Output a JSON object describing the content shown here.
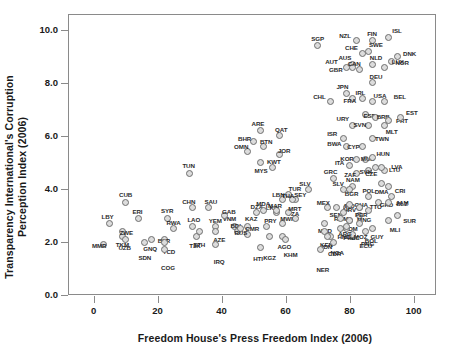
{
  "chart_data": {
    "type": "scatter",
    "title": "",
    "xlabel": "Freedom House's Press Freedom Index (2006)",
    "ylabel": "Transparency International's Corruption\nPerception Index (2006)",
    "xlim": [
      -8,
      107
    ],
    "ylim": [
      0.0,
      10.6
    ],
    "xticks": [
      0,
      20,
      40,
      60,
      80,
      100
    ],
    "xticklabels": [
      "0",
      "20",
      "40",
      "60",
      "80",
      "100"
    ],
    "yticks": [
      0.0,
      2.0,
      4.0,
      6.0,
      8.0,
      10.0
    ],
    "yticklabels": [
      "0.0",
      "2.0",
      "4.0",
      "6.0",
      "8.0",
      "10.0"
    ],
    "grid": false,
    "legend": null,
    "marker": {
      "shape": "circle",
      "face_color": "#dcdcdc",
      "edge_color": "#6f6f6f",
      "size": 7
    },
    "frame_color": "#8a8a8a",
    "points": [
      {
        "label": "SGP",
        "x": 70,
        "y": 9.4,
        "lx": 0,
        "ly": -8
      },
      {
        "label": "NZL",
        "x": 82,
        "y": 9.6,
        "lx": -11,
        "ly": -6
      },
      {
        "label": "FIN",
        "x": 87,
        "y": 9.6,
        "lx": 0,
        "ly": -8
      },
      {
        "label": "ISL",
        "x": 92,
        "y": 9.7,
        "lx": 9,
        "ly": -8
      },
      {
        "label": "CHE",
        "x": 84,
        "y": 9.1,
        "lx": -11,
        "ly": -7
      },
      {
        "label": "DNK",
        "x": 95,
        "y": 9.0,
        "lx": 12,
        "ly": -3
      },
      {
        "label": "AUS",
        "x": 81,
        "y": 8.7,
        "lx": -8,
        "ly": -7
      },
      {
        "label": "SWE",
        "x": 86,
        "y": 9.2,
        "lx": 7,
        "ly": -7
      },
      {
        "label": "NOR",
        "x": 93,
        "y": 8.8,
        "lx": 11,
        "ly": 0
      },
      {
        "label": "AUT",
        "x": 79,
        "y": 8.6,
        "lx": -15,
        "ly": -6
      },
      {
        "label": "NLD",
        "x": 87,
        "y": 8.7,
        "lx": 4,
        "ly": -7
      },
      {
        "label": "GBR",
        "x": 81,
        "y": 8.6,
        "lx": -17,
        "ly": 2
      },
      {
        "label": "CAN",
        "x": 83,
        "y": 8.5,
        "lx": -5,
        "ly": -7
      },
      {
        "label": "DEU",
        "x": 87,
        "y": 8.0,
        "lx": 4,
        "ly": -7
      },
      {
        "label": "LUX",
        "x": 91,
        "y": 8.6,
        "lx": 13,
        "ly": -6
      },
      {
        "label": "JPN",
        "x": 79,
        "y": 7.6,
        "lx": -4,
        "ly": -8
      },
      {
        "label": "IRL",
        "x": 84,
        "y": 7.4,
        "lx": -2,
        "ly": -7
      },
      {
        "label": "USA",
        "x": 87,
        "y": 7.3,
        "lx": 8,
        "ly": -7
      },
      {
        "label": "BEL",
        "x": 91,
        "y": 7.3,
        "lx": 15,
        "ly": -6
      },
      {
        "label": "CHL",
        "x": 74,
        "y": 7.3,
        "lx": -11,
        "ly": -6
      },
      {
        "label": "FRA",
        "x": 81,
        "y": 7.4,
        "lx": -3,
        "ly": 1
      },
      {
        "label": "ESP",
        "x": 85,
        "y": 6.8,
        "lx": 4,
        "ly": 0
      },
      {
        "label": "BRB",
        "x": 88,
        "y": 6.7,
        "lx": 8,
        "ly": -1
      },
      {
        "label": "PRT",
        "x": 92,
        "y": 6.6,
        "lx": 14,
        "ly": 0
      },
      {
        "label": "URY",
        "x": 81,
        "y": 6.4,
        "lx": -10,
        "ly": -7
      },
      {
        "label": "SVN",
        "x": 86,
        "y": 6.4,
        "lx": -9,
        "ly": -1
      },
      {
        "label": "EST",
        "x": 96,
        "y": 6.7,
        "lx": 11,
        "ly": -5
      },
      {
        "label": "MLT",
        "x": 91,
        "y": 6.4,
        "lx": 7,
        "ly": 6
      },
      {
        "label": "ISR",
        "x": 78,
        "y": 5.9,
        "lx": -11,
        "ly": -6
      },
      {
        "label": "BWA",
        "x": 79,
        "y": 5.6,
        "lx": -12,
        "ly": -4
      },
      {
        "label": "CYP",
        "x": 84,
        "y": 5.6,
        "lx": -9,
        "ly": -1
      },
      {
        "label": "TWN",
        "x": 87,
        "y": 5.9,
        "lx": 10,
        "ly": -1
      },
      {
        "label": "KOR",
        "x": 82,
        "y": 5.1,
        "lx": -9,
        "ly": -2
      },
      {
        "label": "MUS",
        "x": 85,
        "y": 5.1,
        "lx": 2,
        "ly": -2
      },
      {
        "label": "HUN",
        "x": 87,
        "y": 5.2,
        "lx": 11,
        "ly": -4
      },
      {
        "label": "ITA",
        "x": 80,
        "y": 4.9,
        "lx": -10,
        "ly": -3
      },
      {
        "label": "LVA",
        "x": 91,
        "y": 4.7,
        "lx": 12,
        "ly": -4
      },
      {
        "label": "ZAF",
        "x": 82,
        "y": 4.6,
        "lx": -6,
        "ly": 1
      },
      {
        "label": "SVK",
        "x": 86,
        "y": 4.7,
        "lx": -3,
        "ly": 1
      },
      {
        "label": "LTU",
        "x": 90,
        "y": 4.8,
        "lx": 13,
        "ly": 1
      },
      {
        "label": "CZE",
        "x": 88,
        "y": 4.8,
        "lx": -4,
        "ly": 5
      },
      {
        "label": "CRI",
        "x": 92,
        "y": 4.1,
        "lx": 12,
        "ly": 4
      },
      {
        "label": "DMA",
        "x": 90,
        "y": 4.2,
        "lx": 0,
        "ly": 7
      },
      {
        "label": "JAM",
        "x": 93,
        "y": 3.7,
        "lx": 11,
        "ly": 5
      },
      {
        "label": "GRC",
        "x": 75,
        "y": 4.4,
        "lx": -3,
        "ly": -7
      },
      {
        "label": "NAM",
        "x": 81,
        "y": 4.1,
        "lx": 0,
        "ly": -7
      },
      {
        "label": "SLV",
        "x": 78,
        "y": 4.0,
        "lx": -5,
        "ly": -6
      },
      {
        "label": "MEX",
        "x": 73,
        "y": 3.3,
        "lx": -4,
        "ly": -6
      },
      {
        "label": "BGR",
        "x": 80,
        "y": 4.0,
        "lx": 2,
        "ly": 4
      },
      {
        "label": "POL",
        "x": 86,
        "y": 3.7,
        "lx": 0,
        "ly": -7
      },
      {
        "label": "SEN",
        "x": 76,
        "y": 3.3,
        "lx": -1,
        "ly": 6
      },
      {
        "label": "IND",
        "x": 79,
        "y": 3.3,
        "lx": 3,
        "ly": -3
      },
      {
        "label": "GHA",
        "x": 83,
        "y": 3.3,
        "lx": 2,
        "ly": -4
      },
      {
        "label": "TTO",
        "x": 86,
        "y": 3.2,
        "lx": 7,
        "ly": -4
      },
      {
        "label": "GRD",
        "x": 89,
        "y": 3.5,
        "lx": 8,
        "ly": 2
      },
      {
        "label": "BLZ",
        "x": 92,
        "y": 3.5,
        "lx": 14,
        "ly": 1
      },
      {
        "label": "SUR",
        "x": 95,
        "y": 3.0,
        "lx": 12,
        "ly": 4
      },
      {
        "label": "HRV",
        "x": 80,
        "y": 3.4,
        "lx": 0,
        "ly": 4
      },
      {
        "label": "MNG",
        "x": 83,
        "y": 3.0,
        "lx": 5,
        "ly": 3
      },
      {
        "label": "ROM",
        "x": 78,
        "y": 3.1,
        "lx": -2,
        "ly": 5
      },
      {
        "label": "PER",
        "x": 83,
        "y": 3.3,
        "lx": 2,
        "ly": 6
      },
      {
        "label": "DOM",
        "x": 80,
        "y": 2.8,
        "lx": 1,
        "ly": 7
      },
      {
        "label": "PHL",
        "x": 79,
        "y": 2.5,
        "lx": 3,
        "ly": 8
      },
      {
        "label": "GUY",
        "x": 87,
        "y": 2.5,
        "lx": 5,
        "ly": 7
      },
      {
        "label": "MLI",
        "x": 92,
        "y": 2.8,
        "lx": 7,
        "ly": 8
      },
      {
        "label": "PNG",
        "x": 85,
        "y": 2.4,
        "lx": 2,
        "ly": 12
      },
      {
        "label": "MKD",
        "x": 72,
        "y": 2.7,
        "lx": 1,
        "ly": 7
      },
      {
        "label": "KEN",
        "x": 74,
        "y": 2.2,
        "lx": -4,
        "ly": 7
      },
      {
        "label": "HND",
        "x": 77,
        "y": 2.5,
        "lx": 4,
        "ly": 7
      },
      {
        "label": "NIC",
        "x": 79,
        "y": 2.6,
        "lx": 8,
        "ly": 11
      },
      {
        "label": "ECU",
        "x": 81,
        "y": 2.3,
        "lx": 13,
        "ly": 11
      },
      {
        "label": "CDR",
        "x": 75,
        "y": 2.0,
        "lx": 1,
        "ly": 11
      },
      {
        "label": "ARG",
        "x": 77,
        "y": 2.9,
        "lx": 5,
        "ly": 15
      },
      {
        "label": "MOZ",
        "x": 80,
        "y": 2.8,
        "lx": 11,
        "ly": 15
      },
      {
        "label": "BOL",
        "x": 83,
        "y": 2.7,
        "lx": 12,
        "ly": 17
      },
      {
        "label": "IDN",
        "x": 72,
        "y": 2.4,
        "lx": 3,
        "ly": 15
      },
      {
        "label": "NGA",
        "x": 73,
        "y": 2.2,
        "lx": 10,
        "ly": 15
      },
      {
        "label": "NER",
        "x": 71,
        "y": 1.7,
        "lx": 2,
        "ly": 19
      },
      {
        "label": "ARE",
        "x": 52,
        "y": 6.2,
        "lx": -2,
        "ly": -8
      },
      {
        "label": "QAT",
        "x": 58,
        "y": 6.0,
        "lx": 2,
        "ly": -7
      },
      {
        "label": "BHR",
        "x": 50,
        "y": 5.8,
        "lx": -9,
        "ly": -3
      },
      {
        "label": "OMN",
        "x": 48,
        "y": 5.4,
        "lx": -6,
        "ly": -6
      },
      {
        "label": "BTN",
        "x": 53,
        "y": 5.6,
        "lx": 3,
        "ly": -6
      },
      {
        "label": "JOR",
        "x": 58,
        "y": 5.3,
        "lx": 5,
        "ly": -5
      },
      {
        "label": "MYS",
        "x": 52,
        "y": 5.0,
        "lx": 1,
        "ly": 7
      },
      {
        "label": "KWT",
        "x": 56,
        "y": 4.8,
        "lx": 1,
        "ly": -7
      },
      {
        "label": "TUN",
        "x": 30,
        "y": 4.6,
        "lx": -1,
        "ly": -8
      },
      {
        "label": "DZA",
        "x": 51,
        "y": 3.1,
        "lx": 0,
        "ly": -7
      },
      {
        "label": "LKA",
        "x": 57,
        "y": 3.1,
        "lx": -4,
        "ly": -6
      },
      {
        "label": "TUR",
        "x": 61,
        "y": 3.8,
        "lx": 6,
        "ly": -6
      },
      {
        "label": "TZA",
        "x": 63,
        "y": 2.9,
        "lx": -2,
        "ly": -5
      },
      {
        "label": "LBN",
        "x": 59,
        "y": 3.6,
        "lx": -4,
        "ly": -6
      },
      {
        "label": "SEY",
        "x": 63,
        "y": 3.6,
        "lx": 5,
        "ly": -6
      },
      {
        "label": "THA",
        "x": 62,
        "y": 3.6,
        "lx": -4,
        "ly": -5
      },
      {
        "label": "MRT",
        "x": 61,
        "y": 3.1,
        "lx": 6,
        "ly": -5
      },
      {
        "label": "VNM",
        "x": 44,
        "y": 2.6,
        "lx": -5,
        "ly": -8
      },
      {
        "label": "KAZ",
        "x": 48,
        "y": 2.6,
        "lx": 4,
        "ly": -8
      },
      {
        "label": "MDA",
        "x": 53,
        "y": 3.2,
        "lx": 0,
        "ly": -7
      },
      {
        "label": "MAR",
        "x": 57,
        "y": 3.2,
        "lx": -1,
        "ly": -5
      },
      {
        "label": "CUB",
        "x": 10,
        "y": 3.5,
        "lx": 0,
        "ly": -8
      },
      {
        "label": "ERI",
        "x": 14,
        "y": 2.9,
        "lx": -1,
        "ly": -7
      },
      {
        "label": "SYR",
        "x": 23,
        "y": 2.9,
        "lx": 0,
        "ly": -8
      },
      {
        "label": "CHN",
        "x": 31,
        "y": 3.3,
        "lx": -4,
        "ly": -7
      },
      {
        "label": "SAU",
        "x": 36,
        "y": 3.3,
        "lx": 2,
        "ly": -7
      },
      {
        "label": "GAB",
        "x": 41,
        "y": 3.0,
        "lx": 4,
        "ly": -5
      },
      {
        "label": "LBY",
        "x": 5,
        "y": 2.7,
        "lx": -2,
        "ly": -7
      },
      {
        "label": "LAO",
        "x": 31,
        "y": 2.6,
        "lx": 1,
        "ly": -7
      },
      {
        "label": "RWA",
        "x": 25,
        "y": 2.5,
        "lx": 0,
        "ly": -7
      },
      {
        "label": "YEM",
        "x": 38,
        "y": 2.6,
        "lx": 0,
        "ly": -6
      },
      {
        "label": "BDI",
        "x": 45,
        "y": 2.4,
        "lx": -2,
        "ly": -6
      },
      {
        "label": "CMR",
        "x": 48,
        "y": 2.3,
        "lx": 5,
        "ly": -6
      },
      {
        "label": "PRY",
        "x": 54,
        "y": 2.6,
        "lx": 4,
        "ly": -6
      },
      {
        "label": "MWI",
        "x": 59,
        "y": 2.7,
        "lx": 4,
        "ly": -5
      },
      {
        "label": "TKM",
        "x": 9,
        "y": 2.2,
        "lx": 0,
        "ly": 7
      },
      {
        "label": "MMR",
        "x": 3,
        "y": 1.9,
        "lx": -4,
        "ly": 0
      },
      {
        "label": "ZWE",
        "x": 9,
        "y": 2.4,
        "lx": 4,
        "ly": 1
      },
      {
        "label": "BLR",
        "x": 22,
        "y": 2.1,
        "lx": 0,
        "ly": 1
      },
      {
        "label": "RUS",
        "x": 46,
        "y": 2.5,
        "lx": 0,
        "ly": 3
      },
      {
        "label": "UZB",
        "x": 10,
        "y": 2.1,
        "lx": -1,
        "ly": 8
      },
      {
        "label": "GNQ",
        "x": 18,
        "y": 2.1,
        "lx": -1,
        "ly": 9
      },
      {
        "label": "TCD",
        "x": 22,
        "y": 2.0,
        "lx": 5,
        "ly": 9
      },
      {
        "label": "TJK",
        "x": 32,
        "y": 2.2,
        "lx": -1,
        "ly": 8
      },
      {
        "label": "AZE",
        "x": 38,
        "y": 2.4,
        "lx": 4,
        "ly": 8
      },
      {
        "label": "SDN",
        "x": 16,
        "y": 2.0,
        "lx": 0,
        "ly": 15
      },
      {
        "label": "COG",
        "x": 22,
        "y": 1.7,
        "lx": 4,
        "ly": 17
      },
      {
        "label": "ETH",
        "x": 33,
        "y": 2.4,
        "lx": 0,
        "ly": 13
      },
      {
        "label": "IRQ",
        "x": 38,
        "y": 1.9,
        "lx": 4,
        "ly": 16
      },
      {
        "label": "HTI",
        "x": 52,
        "y": 1.8,
        "lx": -2,
        "ly": 11
      },
      {
        "label": "AGO",
        "x": 59,
        "y": 2.2,
        "lx": 2,
        "ly": 9
      },
      {
        "label": "KHM",
        "x": 60,
        "y": 2.1,
        "lx": 5,
        "ly": 15
      },
      {
        "label": "KGZ",
        "x": 55,
        "y": 2.2,
        "lx": 0,
        "ly": 20
      },
      {
        "label": "SLV",
        "x": 67,
        "y": 4.0,
        "lx": -3,
        "ly": -6
      }
    ]
  }
}
